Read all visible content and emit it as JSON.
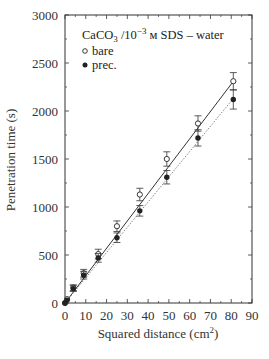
{
  "chart_data": {
    "type": "scatter",
    "title_parts": {
      "main": "CaCO",
      "sub": "3",
      "mid": " /10",
      "sup": "−3",
      "tail": " м SDS – water"
    },
    "xlabel": "Squared distance (cm²)",
    "xlabel_parts": {
      "main": "Squared distance (cm",
      "sup": "2",
      "tail": ")"
    },
    "ylabel": "Penetration time (s)",
    "xlim": [
      0,
      90
    ],
    "ylim": [
      0,
      3000
    ],
    "xticks": [
      0,
      10,
      20,
      30,
      40,
      50,
      60,
      70,
      80,
      90
    ],
    "yticks": [
      0,
      500,
      1000,
      1500,
      2000,
      2500,
      3000
    ],
    "grid": false,
    "legend_position": "upper left",
    "x": [
      0,
      1,
      4,
      9,
      16,
      25,
      36,
      49,
      64,
      81
    ],
    "series": [
      {
        "name": "bare",
        "marker": "open-circle",
        "line": "solid",
        "values": [
          0,
          40,
          160,
          310,
          510,
          800,
          1130,
          1500,
          1870,
          2310
        ],
        "errors": [
          15,
          20,
          30,
          40,
          50,
          55,
          65,
          75,
          80,
          90
        ],
        "fit": {
          "slope": 28.5,
          "intercept": 0
        }
      },
      {
        "name": "prec.",
        "marker": "filled-circle",
        "line": "dotted",
        "values": [
          0,
          30,
          150,
          290,
          470,
          680,
          960,
          1310,
          1720,
          2120
        ],
        "errors": [
          15,
          20,
          30,
          40,
          45,
          50,
          55,
          70,
          85,
          100
        ],
        "fit": {
          "slope": 26.3,
          "intercept": 0
        }
      }
    ]
  }
}
